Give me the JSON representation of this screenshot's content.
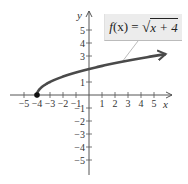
{
  "chart_data": {
    "type": "line",
    "title": "",
    "function_label": "f(x) = √(x + 4)",
    "xlabel": "x",
    "ylabel": "y",
    "xlim": [
      -5,
      5
    ],
    "ylim": [
      -5,
      5
    ],
    "x_ticks": [
      -5,
      -4,
      -3,
      -2,
      -1,
      1,
      2,
      3,
      4,
      5
    ],
    "y_ticks": [
      -5,
      -4,
      -3,
      -2,
      -1,
      1,
      3,
      4,
      5
    ],
    "x_tick_labels": [
      "−5",
      "−4",
      "−3",
      "−2",
      "−1",
      "1",
      "2",
      "3",
      "4",
      "5"
    ],
    "y_tick_labels": [
      "−5",
      "−4",
      "−3",
      "−2",
      "−1",
      "1",
      "3",
      "4",
      "5"
    ],
    "grid": false,
    "series": [
      {
        "name": "f(x) = √(x + 4)",
        "start_point": [
          -4,
          0
        ],
        "start_point_filled": true,
        "arrow_at_end": true,
        "x": [
          -4,
          -3,
          -2,
          -1,
          0,
          1,
          2,
          3,
          4,
          5.9
        ],
        "y": [
          0,
          1,
          1.414,
          1.732,
          2,
          2.236,
          2.449,
          2.646,
          2.828,
          3.146
        ]
      }
    ],
    "colors": {
      "curve": "#4a4a4a",
      "axes": "#555555",
      "label_box": "#ececec"
    }
  },
  "label": {
    "f": "f",
    "x_paren": "(x)",
    "eq": " = ",
    "sqrt": "√",
    "radicand": "x + 4"
  },
  "axes": {
    "x_label": "x",
    "y_label": "y"
  }
}
